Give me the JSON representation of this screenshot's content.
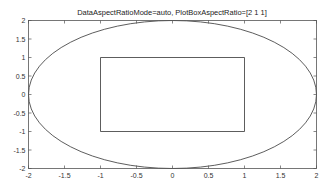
{
  "chart_data": {
    "type": "line",
    "title": "DataAspectRatioMode=auto, PlotBoxAspectRatio=[2 1 1]",
    "xlabel": "",
    "ylabel": "",
    "xlim": [
      -2,
      2
    ],
    "ylim": [
      -2,
      2
    ],
    "grid": false,
    "legend": null,
    "x_ticks": [
      "-2",
      "-1.5",
      "-1",
      "-0.5",
      "0",
      "0.5",
      "1",
      "1.5",
      "2"
    ],
    "y_ticks": [
      "2",
      "1.5",
      "1",
      "0.5",
      "0",
      "-0.5",
      "-1",
      "-1.5",
      "-2"
    ],
    "series": [
      {
        "name": "circle",
        "shape": "circle",
        "center": [
          0,
          0
        ],
        "radius": 2,
        "color": "#333333"
      },
      {
        "name": "rectangle",
        "shape": "rectangle",
        "x": [
          -1,
          1,
          1,
          -1,
          -1
        ],
        "y": [
          1,
          1,
          -1,
          -1,
          1
        ],
        "color": "#333333"
      }
    ]
  },
  "axes": {
    "title": "DataAspectRatioMode=auto, PlotBoxAspectRatio=[2 1 1]",
    "x_ticks": [
      "-2",
      "-1.5",
      "-1",
      "-0.5",
      "0",
      "0.5",
      "1",
      "1.5",
      "2"
    ],
    "y_ticks": [
      "2",
      "1.5",
      "1",
      "0.5",
      "0",
      "-0.5",
      "-1",
      "-1.5",
      "-2"
    ]
  }
}
